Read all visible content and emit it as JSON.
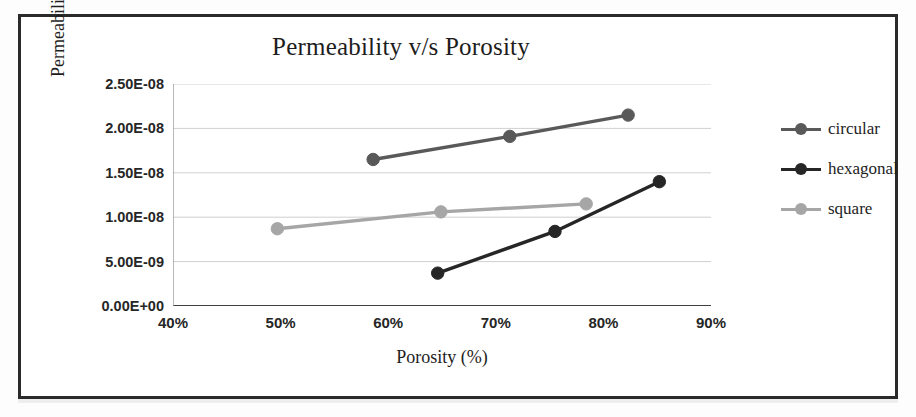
{
  "chart_data": {
    "type": "line",
    "title": "Permeability v/s Porosity",
    "xlabel": "Porosity (%)",
    "ylabel": "Permeability (m²)",
    "xlim": [
      40,
      90
    ],
    "ylim": [
      0,
      2.5e-08
    ],
    "grid": true,
    "legend_position": "right",
    "xticks": [
      "40%",
      "50%",
      "60%",
      "70%",
      "80%",
      "90%"
    ],
    "xtick_values": [
      40,
      50,
      60,
      70,
      80,
      90
    ],
    "yticks": [
      "0.00E+00",
      "5.00E-09",
      "1.00E-08",
      "1.50E-08",
      "2.00E-08",
      "2.50E-08"
    ],
    "ytick_values": [
      0,
      5e-09,
      1e-08,
      1.5e-08,
      2e-08,
      2.5e-08
    ],
    "series": [
      {
        "name": "circular",
        "color": "#595959",
        "x": [
          58.6,
          71.3,
          82.3
        ],
        "y": [
          1.65e-08,
          1.91e-08,
          2.15e-08
        ]
      },
      {
        "name": "hexagonal",
        "color": "#262626",
        "x": [
          64.6,
          75.5,
          85.2
        ],
        "y": [
          3.7e-09,
          8.4e-09,
          1.4e-08
        ]
      },
      {
        "name": "square",
        "color": "#a6a6a6",
        "x": [
          49.7,
          64.9,
          78.4
        ],
        "y": [
          8.7e-09,
          1.06e-08,
          1.15e-08
        ]
      }
    ]
  },
  "legend": {
    "items": [
      {
        "label": "circular"
      },
      {
        "label": "hexagonal"
      },
      {
        "label": "square"
      }
    ]
  }
}
